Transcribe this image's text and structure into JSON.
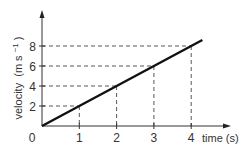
{
  "chart_data": {
    "type": "line",
    "title": "",
    "xlabel": "time (s)",
    "ylabel": "velocity (m s⁻¹)",
    "ylabel_parts": {
      "main": "velocity",
      "unit": "(m s",
      "sup": "−1",
      "close": ")"
    },
    "origin_label": "0",
    "x_ticks": [
      1,
      2,
      3,
      4
    ],
    "y_ticks": [
      2,
      4,
      6,
      8
    ],
    "xlim": [
      0,
      4.6
    ],
    "ylim": [
      0,
      9.2
    ],
    "grid": "dashed drop-lines from data points to axes",
    "series": [
      {
        "name": "velocity",
        "x": [
          0,
          1,
          2,
          3,
          4,
          4.3
        ],
        "y": [
          0,
          2,
          4,
          6,
          8,
          8.6
        ]
      }
    ],
    "annotations": [
      {
        "type": "dashed-guide",
        "x": 1,
        "y": 2
      },
      {
        "type": "dashed-guide",
        "x": 2,
        "y": 4
      },
      {
        "type": "dashed-guide",
        "x": 3,
        "y": 6
      },
      {
        "type": "dashed-guide",
        "x": 4,
        "y": 8
      }
    ],
    "line_color": "#111111",
    "axis_color": "#333333"
  }
}
